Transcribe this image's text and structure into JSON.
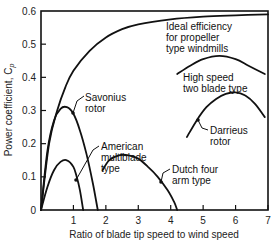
{
  "chart_data": {
    "type": "line",
    "title": "",
    "xlabel": "Ratio of blade tip speed to wind speed",
    "ylabel": "Power coefficient, C",
    "ylabel_sub": "p",
    "xlim": [
      0,
      7
    ],
    "ylim": [
      0,
      0.6
    ],
    "x_ticks": [
      "1",
      "2",
      "3",
      "4",
      "5",
      "6",
      "7"
    ],
    "y_ticks": [
      "0",
      "0.1",
      "0.2",
      "0.3",
      "0.4",
      "0.5",
      "0.6"
    ],
    "grid": false,
    "legend": "inline annotations",
    "series": [
      {
        "name": "Ideal efficiency for propeller type windmills",
        "label_lines": [
          "Ideal efficiency",
          "for propeller",
          "type windmills"
        ],
        "x": [
          0,
          0.25,
          0.5,
          0.75,
          1,
          1.5,
          2,
          2.5,
          3,
          4,
          5,
          6,
          7
        ],
        "y": [
          0,
          0.2,
          0.3,
          0.37,
          0.42,
          0.48,
          0.52,
          0.545,
          0.56,
          0.575,
          0.583,
          0.587,
          0.59
        ]
      },
      {
        "name": "Savonius rotor",
        "label_lines": [
          "Savonius",
          "rotor"
        ],
        "x": [
          0,
          0.2,
          0.4,
          0.6,
          0.8,
          1.0,
          1.2,
          1.4,
          1.6,
          1.75
        ],
        "y": [
          0,
          0.18,
          0.27,
          0.305,
          0.31,
          0.29,
          0.24,
          0.17,
          0.08,
          0
        ]
      },
      {
        "name": "American multiblade type",
        "label_lines": [
          "American",
          "multiblade",
          "type"
        ],
        "x": [
          0,
          0.2,
          0.4,
          0.6,
          0.8,
          1.0,
          1.1,
          1.2,
          1.3
        ],
        "y": [
          0,
          0.07,
          0.12,
          0.145,
          0.15,
          0.13,
          0.1,
          0.06,
          0
        ]
      },
      {
        "name": "Dutch four arm type",
        "label_lines": [
          "Dutch four",
          "arm type"
        ],
        "x": [
          1.9,
          2.1,
          2.4,
          2.7,
          3.0,
          3.3,
          3.6,
          3.9,
          4.1,
          4.2
        ],
        "y": [
          0.12,
          0.15,
          0.165,
          0.165,
          0.155,
          0.13,
          0.1,
          0.06,
          0.025,
          0
        ]
      },
      {
        "name": "High speed two blade type",
        "label_lines": [
          "High speed",
          "two blade type"
        ],
        "x": [
          4.2,
          4.6,
          5.0,
          5.5,
          6.0,
          6.4,
          6.9
        ],
        "y": [
          0.41,
          0.435,
          0.455,
          0.465,
          0.455,
          0.435,
          0.41
        ]
      },
      {
        "name": "Darrieus rotor",
        "label_lines": [
          "Darrieus",
          "rotor"
        ],
        "x": [
          4.5,
          4.8,
          5.1,
          5.4,
          5.7,
          6.0,
          6.3,
          6.6,
          6.9
        ],
        "y": [
          0.22,
          0.27,
          0.31,
          0.335,
          0.35,
          0.355,
          0.345,
          0.32,
          0.28
        ]
      }
    ]
  }
}
